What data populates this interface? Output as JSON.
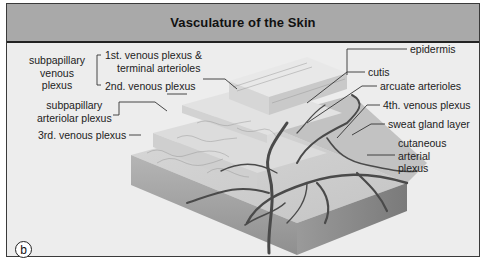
{
  "figure": {
    "title": "Vasculature of the Skin",
    "panel_label": "b",
    "colors": {
      "title_bar": "#a9a9a9",
      "background": "#ededed",
      "border": "#3a3a3a",
      "vessels": "#4a4a4a"
    }
  },
  "labels_left": {
    "subpapillary_venous_plexus": [
      "subpapillary",
      "venous",
      "plexus"
    ],
    "first_venous_plexus": [
      "1st. venous plexus &",
      "terminal arterioles"
    ],
    "second_venous_plexus": "2nd. venous plexus",
    "subpapillary_arteriolar_plexus": [
      "subpapillary",
      "arteriolar plexus"
    ],
    "third_venous_plexus": "3rd. venous plexus"
  },
  "labels_right": {
    "epidermis": "epidermis",
    "cutis": "cutis",
    "arcuate_arterioles": "arcuate arterioles",
    "fourth_venous_plexus": "4th. venous plexus",
    "sweat_gland_layer": "sweat gland layer",
    "cutaneous_arterial_plexus": [
      "cutaneous",
      "arterial",
      "plexus"
    ]
  }
}
